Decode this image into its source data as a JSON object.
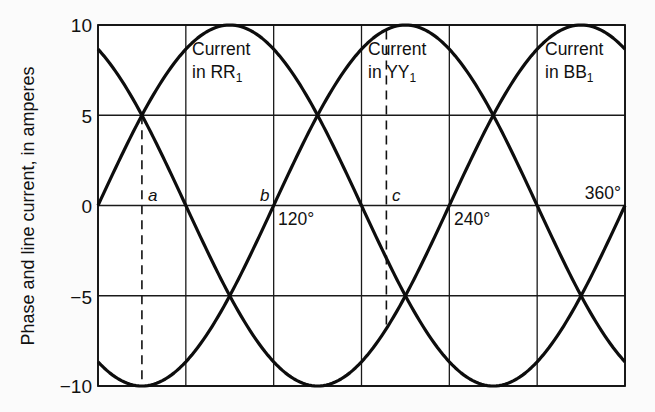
{
  "chart_data": {
    "type": "line",
    "title": "",
    "xlabel": "",
    "ylabel": "Phase and line current, in amperes",
    "x_unit": "degrees",
    "xlim": [
      0,
      360
    ],
    "ylim": [
      -10,
      10
    ],
    "grid": true,
    "x_gridlines": [
      0,
      60,
      120,
      180,
      240,
      300,
      360
    ],
    "y_ticks": [
      10,
      5,
      0,
      -5,
      -10
    ],
    "y_tick_labels": [
      "10",
      "5",
      "0",
      "−5",
      "−10"
    ],
    "x_tick_labels": [
      {
        "value": 120,
        "label": "120°"
      },
      {
        "value": 240,
        "label": "240°"
      },
      {
        "value": 360,
        "label": "360°"
      }
    ],
    "series": [
      {
        "name": "Current in RR1",
        "label_line1": "Current",
        "label_line2": "in RR",
        "label_sub": "1",
        "amplitude": 10,
        "phase_deg": 0,
        "x": [
          0,
          30,
          60,
          90,
          120,
          150,
          180,
          210,
          240,
          270,
          300,
          330,
          360
        ],
        "values": [
          0,
          5,
          8.66,
          10,
          8.66,
          5,
          0,
          -5,
          -8.66,
          -10,
          -8.66,
          -5,
          0
        ]
      },
      {
        "name": "Current in YY1",
        "label_line1": "Current",
        "label_line2": "in YY",
        "label_sub": "1",
        "amplitude": 10,
        "phase_deg": -120,
        "x": [
          0,
          30,
          60,
          90,
          120,
          150,
          180,
          210,
          240,
          270,
          300,
          330,
          360
        ],
        "values": [
          -8.66,
          -10,
          -8.66,
          -5,
          0,
          5,
          8.66,
          10,
          8.66,
          5,
          0,
          -5,
          -8.66
        ]
      },
      {
        "name": "Current in BB1",
        "label_line1": "Current",
        "label_line2": "in BB",
        "label_sub": "1",
        "amplitude": 10,
        "phase_deg": -240,
        "x": [
          0,
          30,
          60,
          90,
          120,
          150,
          180,
          210,
          240,
          270,
          300,
          330,
          360
        ],
        "values": [
          8.66,
          5,
          0,
          -5,
          -8.66,
          -10,
          -8.66,
          -5,
          0,
          5,
          8.66,
          10,
          8.66
        ]
      }
    ],
    "annotations": [
      {
        "label": "a",
        "type": "dashed-vertical",
        "x_deg": 30,
        "y_from": 5,
        "y_to": -10
      },
      {
        "label": "b",
        "type": "point-label",
        "x_deg": 120,
        "y": 0
      },
      {
        "label": "c",
        "type": "dashed-vertical",
        "x_deg": 197,
        "y_from": 9.7,
        "y_to": -6.8
      }
    ]
  }
}
